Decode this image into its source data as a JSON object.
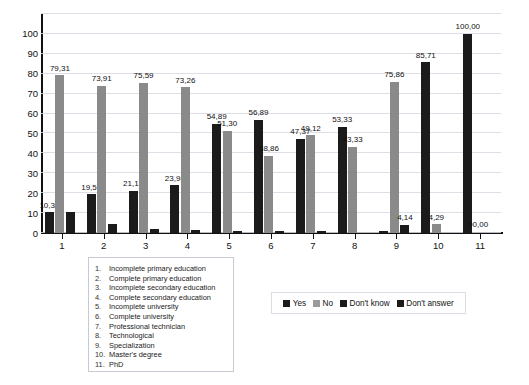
{
  "chart_data": {
    "type": "bar",
    "title": "",
    "xlabel": "",
    "ylabel": "",
    "ylim": [
      0,
      110
    ],
    "yticks": [
      0,
      10,
      20,
      30,
      40,
      50,
      60,
      70,
      80,
      90,
      100
    ],
    "grid": true,
    "legend_position": "bottom-right",
    "categories": [
      "1",
      "2",
      "3",
      "4",
      "5",
      "6",
      "7",
      "8",
      "9",
      "10",
      "11"
    ],
    "category_names": [
      "Incomplete primary education",
      "Complete primary education",
      "Incomplete secondary education",
      "Complete  secondary education",
      "Incomplete university",
      "Complete university",
      "Professional technician",
      "Technological",
      "Specialization",
      "Master's degree",
      "PhD"
    ],
    "series": [
      {
        "name": "Yes",
        "color": "#1b1b1b",
        "values": [
          10.34,
          19.57,
          21.13,
          23.98,
          54.89,
          56.89,
          47.37,
          53.33,
          1.0,
          85.71,
          100.0
        ],
        "labels": [
          "10,34",
          "19,57",
          "21,13",
          "23,98",
          "54,89",
          "56,89",
          "47,37",
          "53,33",
          "",
          "85,71",
          "100,00"
        ]
      },
      {
        "name": "No",
        "color": "#8a8a8a",
        "values": [
          79.31,
          73.91,
          75.59,
          73.26,
          51.3,
          38.86,
          49.12,
          43.33,
          75.86,
          4.29,
          0.0
        ],
        "labels": [
          "79,31",
          "73,91",
          "75,59",
          "73,26",
          "51,30",
          "38,86",
          "49,12",
          "43,33",
          "75,86",
          "4,29",
          "00,00"
        ]
      },
      {
        "name": "Don't know",
        "color": "#1b1b1b",
        "values": [
          10.34,
          4.5,
          2.0,
          1.4,
          1.0,
          1.0,
          1.0,
          0.0,
          4.14,
          0.0,
          0.0
        ],
        "labels": [
          "",
          "",
          "",
          "",
          "",
          "",
          "",
          "",
          "4,14",
          "",
          ""
        ]
      },
      {
        "name": "Don't answer",
        "color": "#1b1b1b",
        "values": [
          0,
          0,
          0,
          0,
          0,
          0,
          0,
          0,
          0,
          0,
          0
        ],
        "labels": [
          "",
          "",
          "",
          "",
          "",
          "",
          "",
          "",
          "",
          "",
          ""
        ]
      }
    ]
  },
  "legend": {
    "items": [
      {
        "label": "Yes",
        "swatch": "sw-yes"
      },
      {
        "label": "No",
        "swatch": "sw-no"
      },
      {
        "label": "Don't know",
        "swatch": "sw-dk"
      },
      {
        "label": "Don't answer",
        "swatch": "sw-da"
      }
    ]
  },
  "category_legend": {
    "rows": [
      {
        "num": "1.",
        "name": "Incomplete primary education"
      },
      {
        "num": "2.",
        "name": "Complete primary education"
      },
      {
        "num": "3.",
        "name": "Incomplete secondary education"
      },
      {
        "num": "4.",
        "name": "Complete  secondary education"
      },
      {
        "num": "5.",
        "name": "Incomplete university"
      },
      {
        "num": "6.",
        "name": "Complete university"
      },
      {
        "num": "7.",
        "name": "Professional technician"
      },
      {
        "num": "8.",
        "name": "Technological"
      },
      {
        "num": "9.",
        "name": "Specialization"
      },
      {
        "num": "10.",
        "name": "Master's degree"
      },
      {
        "num": "11.",
        "name": "PhD"
      }
    ]
  }
}
